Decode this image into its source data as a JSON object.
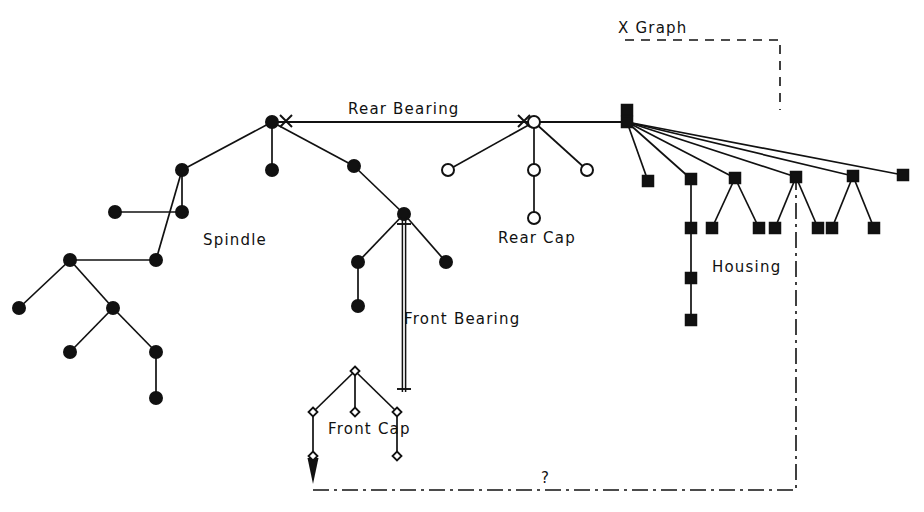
{
  "diagram": {
    "background_color": "#ffffff",
    "ink_color": "#111111",
    "labels": {
      "x_graph": "X Graph",
      "rear_bearing": "Rear Bearing",
      "spindle": "Spindle",
      "rear_cap": "Rear Cap",
      "housing": "Housing",
      "front_bearing": "Front Bearing",
      "front_cap": "Front Cap",
      "question": "?"
    },
    "label_positions": {
      "x_graph": {
        "x": 618,
        "y": 33
      },
      "rear_bearing": {
        "x": 348,
        "y": 114
      },
      "spindle": {
        "x": 203,
        "y": 245
      },
      "rear_cap": {
        "x": 498,
        "y": 243
      },
      "housing": {
        "x": 712,
        "y": 272
      },
      "front_bearing": {
        "x": 404,
        "y": 324
      },
      "front_cap": {
        "x": 328,
        "y": 434
      },
      "question": {
        "x": 541,
        "y": 483
      }
    },
    "node_styles": {
      "filled_circle": {
        "shape": "circle",
        "fill": "#111111",
        "radius": 6
      },
      "hollow_circle": {
        "shape": "circle",
        "fill": "#ffffff",
        "radius": 6
      },
      "filled_square": {
        "shape": "square",
        "fill": "#111111",
        "size": 11
      },
      "hollow_diamond": {
        "shape": "diamond",
        "fill": "#ffffff",
        "size": 9
      }
    },
    "groups": [
      {
        "name": "spindle",
        "node_style": "filled_circle",
        "label": "Spindle"
      },
      {
        "name": "rear-cap",
        "node_style": "hollow_circle",
        "label": "Rear Cap"
      },
      {
        "name": "housing",
        "node_style": "filled_square",
        "label": "Housing"
      },
      {
        "name": "front-cap",
        "node_style": "hollow_diamond",
        "label": "Front Cap"
      }
    ],
    "nodes": {
      "spindle": [
        {
          "id": "s-root",
          "x": 272,
          "y": 122
        },
        {
          "id": "s-a",
          "x": 272,
          "y": 170
        },
        {
          "id": "s-b",
          "x": 182,
          "y": 170
        },
        {
          "id": "s-c",
          "x": 182,
          "y": 212
        },
        {
          "id": "s-d",
          "x": 115,
          "y": 212
        },
        {
          "id": "s-e",
          "x": 156,
          "y": 260
        },
        {
          "id": "s-f",
          "x": 70,
          "y": 260
        },
        {
          "id": "s-g",
          "x": 19,
          "y": 308
        },
        {
          "id": "s-h",
          "x": 113,
          "y": 308
        },
        {
          "id": "s-i",
          "x": 70,
          "y": 352
        },
        {
          "id": "s-j",
          "x": 156,
          "y": 352
        },
        {
          "id": "s-k",
          "x": 156,
          "y": 398
        },
        {
          "id": "s-l",
          "x": 354,
          "y": 166
        },
        {
          "id": "s-m",
          "x": 404,
          "y": 214
        },
        {
          "id": "s-n",
          "x": 358,
          "y": 262
        },
        {
          "id": "s-o",
          "x": 358,
          "y": 306
        },
        {
          "id": "s-p",
          "x": 446,
          "y": 262
        }
      ],
      "rear_cap": [
        {
          "id": "r-root",
          "x": 534,
          "y": 122
        },
        {
          "id": "r-a",
          "x": 534,
          "y": 170
        },
        {
          "id": "r-b",
          "x": 534,
          "y": 218
        },
        {
          "id": "r-c",
          "x": 448,
          "y": 170
        },
        {
          "id": "r-d",
          "x": 587,
          "y": 170
        }
      ],
      "housing": [
        {
          "id": "h-top",
          "x": 627,
          "y": 110
        },
        {
          "id": "h-hub",
          "x": 627,
          "y": 122
        },
        {
          "id": "h-1",
          "x": 648,
          "y": 181
        },
        {
          "id": "h-2",
          "x": 691,
          "y": 179
        },
        {
          "id": "h-2a",
          "x": 691,
          "y": 228
        },
        {
          "id": "h-2b",
          "x": 691,
          "y": 278
        },
        {
          "id": "h-2c",
          "x": 691,
          "y": 320
        },
        {
          "id": "h-3",
          "x": 735,
          "y": 178
        },
        {
          "id": "h-3a",
          "x": 712,
          "y": 228
        },
        {
          "id": "h-3b",
          "x": 759,
          "y": 228
        },
        {
          "id": "h-4",
          "x": 796,
          "y": 177
        },
        {
          "id": "h-4a",
          "x": 775,
          "y": 228
        },
        {
          "id": "h-4b",
          "x": 818,
          "y": 228
        },
        {
          "id": "h-5",
          "x": 853,
          "y": 176
        },
        {
          "id": "h-5a",
          "x": 832,
          "y": 228
        },
        {
          "id": "h-5b",
          "x": 874,
          "y": 228
        },
        {
          "id": "h-6",
          "x": 903,
          "y": 175
        }
      ],
      "front_cap": [
        {
          "id": "f-root",
          "x": 355,
          "y": 371
        },
        {
          "id": "f-a",
          "x": 313,
          "y": 412
        },
        {
          "id": "f-b",
          "x": 355,
          "y": 412
        },
        {
          "id": "f-c",
          "x": 397,
          "y": 412
        },
        {
          "id": "f-d",
          "x": 313,
          "y": 456
        },
        {
          "id": "f-e",
          "x": 397,
          "y": 456
        }
      ]
    },
    "markers": {
      "x_marks": [
        {
          "x": 286,
          "y": 121
        },
        {
          "x": 524,
          "y": 121
        }
      ],
      "arrow_head": {
        "x": 313,
        "y": 470
      },
      "tick_ends": [
        {
          "x": 404,
          "y": 224
        },
        {
          "x": 404,
          "y": 389
        }
      ]
    },
    "connector_lines": {
      "rear_bearing": {
        "from_x": 272,
        "from_y": 122,
        "to_x": 627,
        "to_y": 122,
        "style": "solid"
      },
      "front_bearing": {
        "from_x": 404,
        "from_y": 220,
        "to_x": 404,
        "to_y": 392,
        "style": "double-solid"
      },
      "x_graph_bracket": {
        "points": "625,40 780,40 780,110",
        "style": "dashed"
      },
      "question_link": {
        "points": "313,490 796,490 796,182",
        "style": "dash-dot"
      }
    }
  }
}
